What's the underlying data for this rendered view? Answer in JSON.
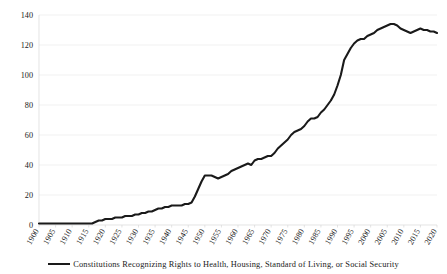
{
  "chart_data": {
    "type": "line",
    "title": "",
    "subtitle": "",
    "xlabel": "",
    "ylabel": "",
    "xlim": [
      1900,
      2020
    ],
    "ylim": [
      0,
      140
    ],
    "grid": true,
    "legend_position": "bottom",
    "y_ticks": [
      0,
      20,
      40,
      60,
      80,
      100,
      120,
      140
    ],
    "x_ticks": [
      1900,
      1905,
      1910,
      1915,
      1920,
      1925,
      1930,
      1935,
      1940,
      1945,
      1950,
      1955,
      1960,
      1965,
      1970,
      1975,
      1980,
      1985,
      1990,
      1995,
      2000,
      2005,
      2010,
      2015,
      2020
    ],
    "series": [
      {
        "name": "Constitutions Recognizing Rights to Health, Housing, Standard of Living, or Social Security",
        "color": "#1a1a1a",
        "x": [
          1900,
          1901,
          1902,
          1903,
          1904,
          1905,
          1906,
          1907,
          1908,
          1909,
          1910,
          1911,
          1912,
          1913,
          1914,
          1915,
          1916,
          1917,
          1918,
          1919,
          1920,
          1921,
          1922,
          1923,
          1924,
          1925,
          1926,
          1927,
          1928,
          1929,
          1930,
          1931,
          1932,
          1933,
          1934,
          1935,
          1936,
          1937,
          1938,
          1939,
          1940,
          1941,
          1942,
          1943,
          1944,
          1945,
          1946,
          1947,
          1948,
          1949,
          1950,
          1951,
          1952,
          1953,
          1954,
          1955,
          1956,
          1957,
          1958,
          1959,
          1960,
          1961,
          1962,
          1963,
          1964,
          1965,
          1966,
          1967,
          1968,
          1969,
          1970,
          1971,
          1972,
          1973,
          1974,
          1975,
          1976,
          1977,
          1978,
          1979,
          1980,
          1981,
          1982,
          1983,
          1984,
          1985,
          1986,
          1987,
          1988,
          1989,
          1990,
          1991,
          1992,
          1993,
          1994,
          1995,
          1996,
          1997,
          1998,
          1999,
          2000,
          2001,
          2002,
          2003,
          2004,
          2005,
          2006,
          2007,
          2008,
          2009,
          2010,
          2011,
          2012,
          2013,
          2014,
          2015,
          2016,
          2017,
          2018,
          2019,
          2020
        ],
        "values": [
          1,
          1,
          1,
          1,
          1,
          1,
          1,
          1,
          1,
          1,
          1,
          1,
          1,
          1,
          1,
          1,
          1,
          2,
          3,
          3,
          4,
          4,
          4,
          5,
          5,
          5,
          6,
          6,
          6,
          7,
          7,
          8,
          8,
          9,
          9,
          10,
          11,
          11,
          12,
          12,
          13,
          13,
          13,
          13,
          14,
          14,
          15,
          19,
          24,
          29,
          33,
          33,
          33,
          32,
          31,
          32,
          33,
          34,
          36,
          37,
          38,
          39,
          40,
          41,
          40,
          43,
          44,
          44,
          45,
          46,
          46,
          48,
          51,
          53,
          55,
          57,
          60,
          62,
          63,
          64,
          66,
          69,
          71,
          71,
          72,
          75,
          77,
          80,
          83,
          87,
          93,
          100,
          110,
          114,
          118,
          121,
          123,
          124,
          124,
          126,
          127,
          128,
          130,
          131,
          132,
          133,
          134,
          134,
          133,
          131,
          130,
          129,
          128,
          129,
          130,
          131,
          130,
          130,
          129,
          129,
          128
        ]
      }
    ],
    "legend": [
      {
        "label": "Constitutions Recognizing Rights to Health, Housing, Standard of Living, or Social Security",
        "color": "#1a1a1a",
        "marker": "line"
      }
    ]
  },
  "style": {
    "line_color": "#1a1a1a",
    "grid_color": "#e8e8e8",
    "axis_color": "#d9d9d9",
    "background": "#ffffff",
    "text_color": "#1a1a1a"
  }
}
